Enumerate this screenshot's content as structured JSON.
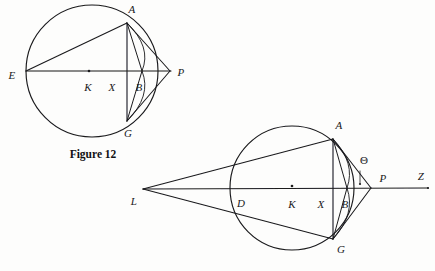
{
  "page": {
    "width": 435,
    "height": 271,
    "background_color": "#fdfdfc",
    "ink_color": "#1a1a1c",
    "caption": "Figure 12"
  },
  "figure_12": {
    "name": "figure-12",
    "caption": "Figure 12",
    "caption_pos": [
      93,
      155
    ],
    "circle": {
      "cx": 92,
      "cy": 71,
      "r": 66
    },
    "points": {
      "E": {
        "x": 26,
        "y": 71,
        "label": "E",
        "label_pos": [
          12,
          75
        ]
      },
      "A": {
        "x": 127,
        "y": 23,
        "label": "A",
        "label_pos": [
          132,
          9
        ]
      },
      "G": {
        "x": 127,
        "y": 121,
        "label": "G",
        "label_pos": [
          128,
          133
        ]
      },
      "K": {
        "x": 89,
        "y": 71,
        "label": "K",
        "label_pos": [
          88,
          87
        ]
      },
      "X": {
        "x": 113,
        "y": 71,
        "label": "X",
        "label_pos": [
          112,
          87
        ]
      },
      "B": {
        "x": 142,
        "y": 71,
        "label": "B",
        "label_pos": [
          139,
          87
        ]
      },
      "P": {
        "x": 170,
        "y": 71,
        "label": "P",
        "label_pos": [
          181,
          72
        ]
      }
    },
    "segments": [
      {
        "name": "chord-E-A",
        "from": "E",
        "to": "A"
      },
      {
        "name": "chord-E-P",
        "from": "E",
        "to": "P"
      },
      {
        "name": "chord-A-G",
        "from": "A",
        "to": "G"
      },
      {
        "name": "tangent-A-P",
        "from": "A",
        "to": "P"
      },
      {
        "name": "tangent-G-P",
        "from": "G",
        "to": "P"
      },
      {
        "name": "chord-A-B",
        "from": "A",
        "to": "B"
      },
      {
        "name": "chord-G-B",
        "from": "G",
        "to": "B"
      }
    ]
  },
  "figure_2": {
    "name": "figure-lower",
    "circle": {
      "cx": 292,
      "cy": 188,
      "r": 62
    },
    "points": {
      "L": {
        "x": 143,
        "y": 189,
        "label": "L",
        "label_pos": [
          134,
          201
        ]
      },
      "D": {
        "x": 236,
        "y": 188,
        "label": "D",
        "label_pos": [
          241,
          203
        ]
      },
      "K": {
        "x": 292,
        "y": 188,
        "label": "K",
        "label_pos": [
          292,
          204
        ]
      },
      "X": {
        "x": 322,
        "y": 188,
        "label": "X",
        "label_pos": [
          321,
          204
        ]
      },
      "B": {
        "x": 347,
        "y": 188,
        "label": "B",
        "label_pos": [
          345,
          204
        ]
      },
      "A": {
        "x": 333,
        "y": 139,
        "label": "A",
        "label_pos": [
          339,
          125
        ]
      },
      "G": {
        "x": 333,
        "y": 239,
        "label": "G",
        "label_pos": [
          341,
          249
        ]
      },
      "P": {
        "x": 371,
        "y": 188,
        "label": "P",
        "label_pos": [
          383,
          178
        ]
      },
      "Z": {
        "x": 428,
        "y": 188,
        "label": "Z",
        "label_pos": [
          421,
          176
        ]
      }
    },
    "angle_marker": {
      "label": "Θ",
      "label_pos": [
        364,
        160
      ]
    },
    "segments": [
      {
        "name": "ray-L-Z-axis",
        "from": "L",
        "to": "Z"
      },
      {
        "name": "line-L-A",
        "from": "L",
        "to": "A"
      },
      {
        "name": "line-L-G",
        "from": "L",
        "to": "G"
      },
      {
        "name": "chord-A-G",
        "from": "A",
        "to": "G"
      },
      {
        "name": "tangent-A-P",
        "from": "A",
        "to": "P"
      },
      {
        "name": "tangent-G-P",
        "from": "G",
        "to": "P"
      },
      {
        "name": "chord-A-B",
        "from": "A",
        "to": "B"
      },
      {
        "name": "chord-G-B",
        "from": "G",
        "to": "B"
      }
    ]
  }
}
